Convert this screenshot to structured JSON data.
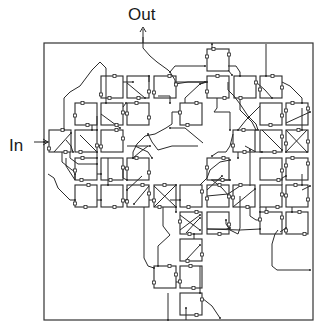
{
  "labels": {
    "output": "Out",
    "input": "In"
  },
  "colors": {
    "stroke": "#2a2a2a",
    "background": "#ffffff"
  },
  "frame": {
    "x": 44,
    "y": 43,
    "w": 269,
    "h": 277
  },
  "box_size": 22,
  "boxes": [
    {
      "x": 207,
      "y": 49
    },
    {
      "x": 101,
      "y": 76
    },
    {
      "x": 127,
      "y": 76
    },
    {
      "x": 154,
      "y": 76
    },
    {
      "x": 207,
      "y": 76
    },
    {
      "x": 234,
      "y": 76
    },
    {
      "x": 260,
      "y": 76
    },
    {
      "x": 75,
      "y": 103
    },
    {
      "x": 101,
      "y": 103
    },
    {
      "x": 127,
      "y": 103
    },
    {
      "x": 180,
      "y": 103
    },
    {
      "x": 260,
      "y": 103
    },
    {
      "x": 286,
      "y": 103
    },
    {
      "x": 49,
      "y": 130
    },
    {
      "x": 75,
      "y": 130
    },
    {
      "x": 101,
      "y": 130
    },
    {
      "x": 233,
      "y": 130
    },
    {
      "x": 260,
      "y": 130
    },
    {
      "x": 286,
      "y": 130
    },
    {
      "x": 75,
      "y": 158
    },
    {
      "x": 101,
      "y": 158
    },
    {
      "x": 127,
      "y": 158
    },
    {
      "x": 207,
      "y": 158
    },
    {
      "x": 260,
      "y": 158
    },
    {
      "x": 286,
      "y": 158
    },
    {
      "x": 75,
      "y": 185
    },
    {
      "x": 101,
      "y": 185
    },
    {
      "x": 127,
      "y": 185
    },
    {
      "x": 154,
      "y": 185
    },
    {
      "x": 180,
      "y": 185
    },
    {
      "x": 207,
      "y": 185
    },
    {
      "x": 233,
      "y": 185
    },
    {
      "x": 260,
      "y": 185
    },
    {
      "x": 286,
      "y": 185
    },
    {
      "x": 180,
      "y": 212
    },
    {
      "x": 207,
      "y": 212
    },
    {
      "x": 260,
      "y": 212
    },
    {
      "x": 286,
      "y": 212
    },
    {
      "x": 180,
      "y": 239
    },
    {
      "x": 154,
      "y": 266
    },
    {
      "x": 180,
      "y": 266
    },
    {
      "x": 180,
      "y": 293
    }
  ],
  "wires": [
    [
      [
        143,
        37
      ],
      [
        143,
        48
      ],
      [
        150,
        56
      ],
      [
        157,
        62
      ],
      [
        168,
        70
      ],
      [
        170,
        72
      ]
    ],
    [
      [
        170,
        72
      ],
      [
        175,
        66
      ],
      [
        205,
        66
      ]
    ],
    [
      [
        170,
        72
      ],
      [
        175,
        80
      ],
      [
        175,
        84
      ],
      [
        188,
        82
      ],
      [
        207,
        82
      ]
    ],
    [
      [
        212,
        49
      ],
      [
        212,
        44
      ]
    ],
    [
      [
        266,
        44
      ],
      [
        266,
        76
      ]
    ],
    [
      [
        228,
        66
      ],
      [
        236,
        66
      ],
      [
        240,
        72
      ],
      [
        240,
        76
      ]
    ],
    [
      [
        228,
        70
      ],
      [
        232,
        75
      ]
    ],
    [
      [
        106,
        76
      ],
      [
        106,
        68
      ],
      [
        100,
        62
      ],
      [
        92,
        70
      ],
      [
        80,
        86
      ],
      [
        70,
        92
      ],
      [
        64,
        98
      ],
      [
        64,
        130
      ]
    ],
    [
      [
        106,
        76
      ],
      [
        106,
        103
      ]
    ],
    [
      [
        123,
        82
      ],
      [
        133,
        82
      ]
    ],
    [
      [
        127,
        83
      ],
      [
        145,
        98
      ]
    ],
    [
      [
        149,
        82
      ],
      [
        149,
        76
      ]
    ],
    [
      [
        158,
        96
      ],
      [
        170,
        96
      ],
      [
        170,
        103
      ]
    ],
    [
      [
        175,
        82
      ],
      [
        205,
        82
      ]
    ],
    [
      [
        180,
        112
      ],
      [
        172,
        112
      ],
      [
        172,
        124
      ],
      [
        166,
        128
      ],
      [
        155,
        134
      ],
      [
        145,
        136
      ],
      [
        137,
        144
      ],
      [
        133,
        152
      ],
      [
        133,
        158
      ]
    ],
    [
      [
        185,
        103
      ],
      [
        185,
        98
      ],
      [
        200,
        84
      ],
      [
        205,
        82
      ]
    ],
    [
      [
        207,
        82
      ],
      [
        200,
        84
      ]
    ],
    [
      [
        217,
        98
      ],
      [
        217,
        108
      ],
      [
        214,
        112
      ],
      [
        230,
        112
      ],
      [
        230,
        130
      ]
    ],
    [
      [
        228,
        82
      ],
      [
        228,
        90
      ],
      [
        234,
        96
      ],
      [
        240,
        104
      ],
      [
        248,
        116
      ],
      [
        256,
        124
      ],
      [
        258,
        130
      ]
    ],
    [
      [
        240,
        97
      ],
      [
        240,
        110
      ],
      [
        252,
        122
      ],
      [
        256,
        130
      ]
    ],
    [
      [
        256,
        82
      ],
      [
        265,
        90
      ],
      [
        272,
        98
      ]
    ],
    [
      [
        282,
        82
      ],
      [
        290,
        86
      ],
      [
        302,
        98
      ],
      [
        302,
        103
      ]
    ],
    [
      [
        260,
        106
      ],
      [
        246,
        120
      ],
      [
        238,
        130
      ]
    ],
    [
      [
        302,
        108
      ],
      [
        302,
        130
      ]
    ],
    [
      [
        286,
        123
      ],
      [
        310,
        112
      ]
    ],
    [
      [
        307,
        130
      ],
      [
        286,
        152
      ]
    ],
    [
      [
        286,
        130
      ],
      [
        307,
        152
      ]
    ],
    [
      [
        262,
        130
      ],
      [
        282,
        150
      ]
    ],
    [
      [
        245,
        146
      ],
      [
        256,
        152
      ],
      [
        262,
        152
      ]
    ],
    [
      [
        238,
        152
      ],
      [
        238,
        158
      ]
    ],
    [
      [
        233,
        134
      ],
      [
        230,
        146
      ],
      [
        226,
        152
      ],
      [
        218,
        152
      ],
      [
        212,
        156
      ]
    ],
    [
      [
        203,
        143
      ],
      [
        185,
        128
      ],
      [
        170,
        128
      ]
    ],
    [
      [
        198,
        146
      ],
      [
        172,
        146
      ],
      [
        158,
        150
      ],
      [
        152,
        142
      ],
      [
        148,
        134
      ]
    ],
    [
      [
        127,
        146
      ],
      [
        150,
        146
      ]
    ],
    [
      [
        148,
        146
      ],
      [
        140,
        152
      ],
      [
        133,
        158
      ]
    ],
    [
      [
        135,
        146
      ],
      [
        148,
        152
      ],
      [
        152,
        158
      ]
    ],
    [
      [
        101,
        114
      ],
      [
        120,
        128
      ]
    ],
    [
      [
        123,
        107
      ],
      [
        126,
        103
      ]
    ],
    [
      [
        92,
        125
      ],
      [
        92,
        130
      ]
    ],
    [
      [
        97,
        116
      ],
      [
        97,
        130
      ]
    ],
    [
      [
        49,
        142
      ],
      [
        44,
        142
      ]
    ],
    [
      [
        54,
        152
      ],
      [
        71,
        133
      ]
    ],
    [
      [
        66,
        140
      ],
      [
        71,
        146
      ],
      [
        73,
        152
      ]
    ],
    [
      [
        80,
        135
      ],
      [
        97,
        152
      ]
    ],
    [
      [
        97,
        152
      ],
      [
        97,
        158
      ]
    ],
    [
      [
        62,
        152
      ],
      [
        62,
        162
      ],
      [
        72,
        170
      ],
      [
        75,
        171
      ]
    ],
    [
      [
        70,
        152
      ],
      [
        70,
        158
      ],
      [
        78,
        164
      ],
      [
        97,
        164
      ]
    ],
    [
      [
        66,
        158
      ],
      [
        66,
        166
      ],
      [
        75,
        180
      ],
      [
        75,
        174
      ]
    ],
    [
      [
        48,
        174
      ],
      [
        54,
        178
      ],
      [
        58,
        188
      ],
      [
        70,
        200
      ],
      [
        75,
        200
      ]
    ],
    [
      [
        97,
        174
      ],
      [
        101,
        174
      ]
    ],
    [
      [
        108,
        158
      ],
      [
        108,
        185
      ]
    ],
    [
      [
        123,
        166
      ],
      [
        123,
        178
      ],
      [
        127,
        180
      ]
    ],
    [
      [
        142,
        176
      ],
      [
        127,
        190
      ]
    ],
    [
      [
        149,
        186
      ],
      [
        134,
        204
      ]
    ],
    [
      [
        97,
        200
      ],
      [
        101,
        200
      ]
    ],
    [
      [
        123,
        200
      ],
      [
        127,
        200
      ]
    ],
    [
      [
        149,
        200
      ],
      [
        154,
        200
      ]
    ],
    [
      [
        170,
        200
      ],
      [
        175,
        200
      ],
      [
        180,
        200
      ]
    ],
    [
      [
        144,
        207
      ],
      [
        144,
        258
      ],
      [
        148,
        266
      ],
      [
        154,
        268
      ]
    ],
    [
      [
        163,
        207
      ],
      [
        163,
        226
      ],
      [
        166,
        230
      ],
      [
        170,
        235
      ],
      [
        158,
        246
      ],
      [
        158,
        266
      ]
    ],
    [
      [
        154,
        186
      ],
      [
        176,
        207
      ]
    ],
    [
      [
        154,
        207
      ],
      [
        176,
        185
      ]
    ],
    [
      [
        176,
        207
      ],
      [
        176,
        212
      ]
    ],
    [
      [
        180,
        215
      ],
      [
        200,
        230
      ]
    ],
    [
      [
        180,
        230
      ],
      [
        200,
        215
      ]
    ],
    [
      [
        200,
        185
      ],
      [
        207,
        178
      ],
      [
        210,
        170
      ],
      [
        220,
        162
      ],
      [
        230,
        160
      ]
    ],
    [
      [
        212,
        180
      ],
      [
        222,
        188
      ],
      [
        229,
        196
      ]
    ],
    [
      [
        207,
        190
      ],
      [
        222,
        176
      ]
    ],
    [
      [
        211,
        180
      ],
      [
        230,
        180
      ]
    ],
    [
      [
        207,
        196
      ],
      [
        228,
        194
      ],
      [
        240,
        186
      ]
    ],
    [
      [
        233,
        207
      ],
      [
        250,
        193
      ],
      [
        255,
        189
      ]
    ],
    [
      [
        240,
        196
      ],
      [
        240,
        207
      ],
      [
        240,
        228
      ],
      [
        238,
        234
      ],
      [
        230,
        230
      ],
      [
        226,
        224
      ],
      [
        226,
        220
      ]
    ],
    [
      [
        207,
        229
      ],
      [
        226,
        229
      ],
      [
        230,
        228
      ]
    ],
    [
      [
        207,
        229
      ],
      [
        240,
        230
      ],
      [
        260,
        229
      ]
    ],
    [
      [
        250,
        207
      ],
      [
        250,
        216
      ],
      [
        256,
        220
      ],
      [
        260,
        220
      ]
    ],
    [
      [
        250,
        186
      ],
      [
        250,
        160
      ],
      [
        250,
        150
      ]
    ],
    [
      [
        260,
        207
      ],
      [
        260,
        212
      ]
    ],
    [
      [
        266,
        207
      ],
      [
        266,
        212
      ]
    ],
    [
      [
        282,
        185
      ],
      [
        282,
        178
      ],
      [
        286,
        176
      ]
    ],
    [
      [
        292,
        207
      ],
      [
        292,
        212
      ]
    ],
    [
      [
        302,
        174
      ],
      [
        302,
        185
      ]
    ],
    [
      [
        278,
        230
      ],
      [
        275,
        234
      ],
      [
        272,
        244
      ],
      [
        272,
        266
      ],
      [
        277,
        270
      ],
      [
        310,
        270
      ]
    ],
    [
      [
        280,
        232
      ],
      [
        286,
        228
      ]
    ],
    [
      [
        186,
        233
      ],
      [
        196,
        222
      ],
      [
        200,
        218
      ]
    ],
    [
      [
        186,
        260
      ],
      [
        200,
        245
      ]
    ],
    [
      [
        194,
        239
      ],
      [
        194,
        234
      ]
    ],
    [
      [
        200,
        266
      ],
      [
        200,
        293
      ]
    ],
    [
      [
        176,
        282
      ],
      [
        180,
        282
      ]
    ],
    [
      [
        168,
        293
      ],
      [
        168,
        320
      ]
    ],
    [
      [
        186,
        320
      ],
      [
        186,
        308
      ]
    ],
    [
      [
        202,
        298
      ],
      [
        212,
        306
      ],
      [
        220,
        318
      ]
    ],
    [
      [
        302,
        190
      ],
      [
        310,
        186
      ]
    ]
  ],
  "arrow_heads": [
    {
      "x": 143,
      "y": 36,
      "dir": "up"
    },
    {
      "x": 47,
      "y": 142,
      "dir": "right"
    }
  ]
}
